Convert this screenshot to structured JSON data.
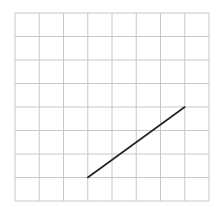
{
  "diagram": {
    "type": "grid-with-line-segment",
    "grid": {
      "columns": 8,
      "rows": 8,
      "origin_px": [
        15,
        13
      ],
      "cell_w_px": 24.25,
      "cell_h_px": 23.5,
      "line_color": "#c8c8c8",
      "line_width": 1
    },
    "segment": {
      "from_grid": [
        3,
        1
      ],
      "to_grid": [
        7,
        4
      ],
      "coordinate_origin": "bottom-left",
      "color": "#222222",
      "width": 1.6
    }
  }
}
